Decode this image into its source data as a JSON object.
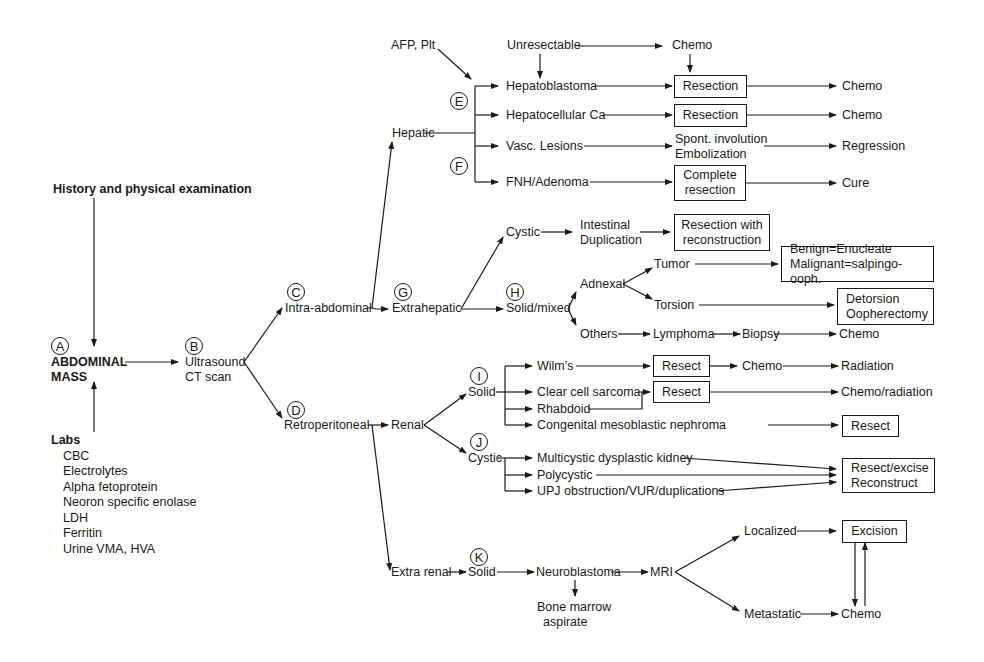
{
  "diagram": {
    "root": {
      "marker": "A",
      "label_line1": "ABDOMINAL",
      "label_line2": "MASS"
    },
    "history": "History and physical examination",
    "labs": {
      "title": "Labs",
      "items": [
        "CBC",
        "Electrolytes",
        "Alpha fetoprotein",
        "Neoron specific enolase",
        "LDH",
        "Ferritin",
        "Urine VMA, HVA"
      ]
    },
    "imaging": {
      "marker": "B",
      "line1": "Ultrasound",
      "line2": "CT scan"
    },
    "intra": {
      "marker": "C",
      "label": "Intra-abdominal"
    },
    "retro": {
      "marker": "D",
      "label": "Retroperitoneal"
    },
    "hepatic": {
      "label": "Hepatic",
      "afp": "AFP, Plt",
      "unresectable": "Unresectable",
      "chemo_top": "Chemo",
      "markers": [
        "E",
        "F"
      ],
      "rows": [
        {
          "dx": "Hepatoblastoma",
          "tx": "Resection",
          "out": "Chemo"
        },
        {
          "dx": "Hepatocellular Ca",
          "tx": "Resection",
          "out": "Chemo"
        },
        {
          "dx": "Vasc. Lesions",
          "tx_line1": "Spont. involution",
          "tx_line2": "Embolization",
          "out": "Regression"
        },
        {
          "dx": "FNH/Adenoma",
          "tx_line1": "Complete",
          "tx_line2": "resection",
          "out": "Cure"
        }
      ]
    },
    "extrahepatic": {
      "marker": "G",
      "label": "Extrahepatic",
      "cystic": "Cystic",
      "intestinal_line1": "Intestinal",
      "intestinal_line2": "Duplication",
      "resection_recon_line1": "Resection with",
      "resection_recon_line2": "reconstruction",
      "solid": {
        "marker": "H",
        "label": "Solid/mixed"
      },
      "adnexal": "Adnexal",
      "tumor": "Tumor",
      "tumor_tx_line1": "Benign=Enucleate",
      "tumor_tx_line2": "Malignant=salpingo-ooph.",
      "torsion": "Torsion",
      "torsion_tx_line1": "Detorsion",
      "torsion_tx_line2": "Oopherectomy",
      "others": "Others",
      "lymphoma": "Lymphoma",
      "biopsy": "Biopsy",
      "chemo": "Chemo"
    },
    "renal": {
      "label": "Renal",
      "solid": {
        "marker": "I",
        "label": "Solid"
      },
      "wilms": "Wilm’s",
      "wilms_tx": "Resect",
      "wilms_chemo": "Chemo",
      "radiation": "Radiation",
      "ccs": "Clear cell sarcoma",
      "rhabdoid": "Rhabdoid",
      "ccs_tx": "Resect",
      "chemo_radiation": "Chemo/radiation",
      "cmn": "Congenital mesoblastic nephroma",
      "cmn_tx": "Resect",
      "cystic": {
        "marker": "J",
        "label": "Cystic"
      },
      "mdk": "Multicystic dysplastic kidney",
      "poly": "Polycystic",
      "upj": "UPJ obstruction/VUR/duplications",
      "cystic_tx_line1": "Resect/excise",
      "cystic_tx_line2": "Reconstruct"
    },
    "extrarenal": {
      "label": "Extra renal",
      "solid": {
        "marker": "K",
        "label": "Solid"
      },
      "neuroblastoma": "Neuroblastoma",
      "bm_line1": "Bone marrow",
      "bm_line2": "aspirate",
      "mri": "MRI",
      "localized": "Localized",
      "metastatic": "Metastatic",
      "excision": "Excision",
      "chemo": "Chemo"
    }
  }
}
